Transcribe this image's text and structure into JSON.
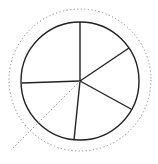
{
  "diagram": {
    "type": "sectioned-circle",
    "center": [
      80,
      81
    ],
    "radius": 59,
    "outer_dotted_circle": {
      "center": [
        80,
        80
      ],
      "radius": 71
    },
    "sections": 5,
    "radii_endpoints": [
      [
        80,
        22
      ],
      [
        129,
        48
      ],
      [
        131,
        109
      ],
      [
        74,
        140
      ],
      [
        22,
        83
      ]
    ],
    "dotted_line": {
      "from": [
        80,
        81
      ],
      "to": [
        11,
        150
      ]
    },
    "colors": {
      "stroke": "#222222",
      "dotted": "#888888",
      "background": "#ffffff"
    }
  }
}
